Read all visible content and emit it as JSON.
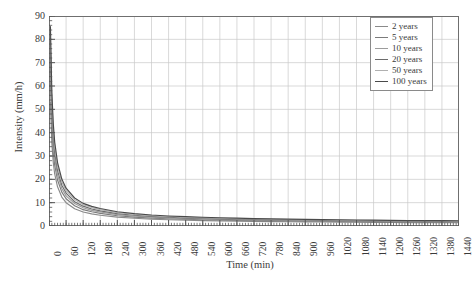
{
  "chart_data": {
    "type": "line",
    "title": "",
    "xlabel": "Time (min)",
    "ylabel": "Intensity (mm/h)",
    "xlim": [
      0,
      1440
    ],
    "ylim": [
      0,
      90
    ],
    "xticks": [
      0,
      60,
      120,
      180,
      240,
      300,
      360,
      420,
      480,
      540,
      600,
      660,
      720,
      780,
      840,
      900,
      960,
      1020,
      1080,
      1140,
      1200,
      1260,
      1320,
      1380,
      1440
    ],
    "yticks": [
      0,
      10,
      20,
      30,
      40,
      50,
      60,
      70,
      80,
      90
    ],
    "xtick_labels": [
      "0",
      "60",
      "120",
      "180",
      "240",
      "300",
      "360",
      "420",
      "480",
      "540",
      "600",
      "660",
      "720",
      "780",
      "840",
      "900",
      "960",
      "1020",
      "1080",
      "1140",
      "1200",
      "1260",
      "1320",
      "1380",
      "1440"
    ],
    "ytick_labels": [
      "0",
      "10",
      "20",
      "30",
      "40",
      "50",
      "60",
      "70",
      "80",
      "90"
    ],
    "y_minor_tick_step": 2,
    "grid": true,
    "grid_color": "#c8c8c8",
    "legend_position": "top-right",
    "x": [
      5,
      10,
      15,
      20,
      30,
      45,
      60,
      90,
      120,
      150,
      180,
      240,
      300,
      360,
      420,
      480,
      540,
      600,
      660,
      720,
      780,
      840,
      900,
      960,
      1020,
      1080,
      1140,
      1200,
      1260,
      1320,
      1380,
      1440
    ],
    "series": [
      {
        "name": "2 years",
        "color": "#8a8a8a",
        "values": [
          53.0,
          35.5,
          27.2,
          22.3,
          16.8,
          12.4,
          10.0,
          7.4,
          6.0,
          5.2,
          4.6,
          3.8,
          3.3,
          2.9,
          2.7,
          2.5,
          2.3,
          2.2,
          2.1,
          2.0,
          1.9,
          1.8,
          1.75,
          1.7,
          1.65,
          1.6,
          1.55,
          1.5,
          1.48,
          1.45,
          1.42,
          1.4
        ]
      },
      {
        "name": "5 years",
        "color": "#7b7b7b",
        "values": [
          62.0,
          41.5,
          31.8,
          26.1,
          19.7,
          14.5,
          11.7,
          8.7,
          7.0,
          6.1,
          5.4,
          4.4,
          3.8,
          3.4,
          3.1,
          2.9,
          2.7,
          2.55,
          2.4,
          2.3,
          2.2,
          2.12,
          2.05,
          1.98,
          1.92,
          1.86,
          1.8,
          1.76,
          1.72,
          1.68,
          1.65,
          1.62
        ]
      },
      {
        "name": "10 years",
        "color": "#9c9c9c",
        "values": [
          68.5,
          45.8,
          35.2,
          28.8,
          21.8,
          16.1,
          12.9,
          9.6,
          7.8,
          6.7,
          6.0,
          4.9,
          4.2,
          3.8,
          3.4,
          3.2,
          3.0,
          2.82,
          2.68,
          2.55,
          2.45,
          2.35,
          2.27,
          2.2,
          2.13,
          2.06,
          2.0,
          1.95,
          1.9,
          1.86,
          1.82,
          1.79
        ]
      },
      {
        "name": "20 years",
        "color": "#6b6b6b",
        "values": [
          74.5,
          49.8,
          38.3,
          31.4,
          23.7,
          17.5,
          14.1,
          10.4,
          8.5,
          7.3,
          6.5,
          5.3,
          4.6,
          4.1,
          3.75,
          3.45,
          3.25,
          3.06,
          2.9,
          2.77,
          2.65,
          2.55,
          2.46,
          2.38,
          2.3,
          2.24,
          2.17,
          2.12,
          2.07,
          2.02,
          1.98,
          1.94
        ]
      },
      {
        "name": "50 years",
        "color": "#b0b0b0",
        "values": [
          80.5,
          53.8,
          41.3,
          33.9,
          25.6,
          18.9,
          15.2,
          11.3,
          9.1,
          7.9,
          7.0,
          5.75,
          4.95,
          4.4,
          4.05,
          3.75,
          3.5,
          3.3,
          3.13,
          2.99,
          2.86,
          2.75,
          2.65,
          2.56,
          2.49,
          2.41,
          2.34,
          2.28,
          2.23,
          2.18,
          2.13,
          2.09
        ]
      },
      {
        "name": "100 years",
        "color": "#4a4a4a",
        "values": [
          85.5,
          57.2,
          43.9,
          36.0,
          27.2,
          20.1,
          16.2,
          12.0,
          9.7,
          8.4,
          7.5,
          6.1,
          5.3,
          4.7,
          4.3,
          4.0,
          3.75,
          3.53,
          3.35,
          3.19,
          3.06,
          2.94,
          2.83,
          2.74,
          2.66,
          2.58,
          2.51,
          2.44,
          2.38,
          2.33,
          2.28,
          2.24
        ]
      }
    ]
  },
  "legend": {
    "items": [
      {
        "label": "2 years"
      },
      {
        "label": "5 years"
      },
      {
        "label": "10 years"
      },
      {
        "label": "20 years"
      },
      {
        "label": "50 years"
      },
      {
        "label": "100 years"
      }
    ]
  },
  "caption": {
    "text": ""
  }
}
